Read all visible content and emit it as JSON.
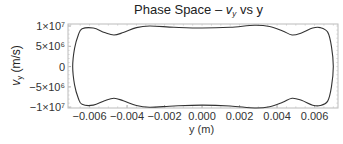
{
  "chart_data": {
    "type": "line",
    "title_parts": {
      "prefix": "Phase Space – ",
      "var": "v",
      "sub": "y",
      "suffix": " vs y"
    },
    "xlabel": "y (m)",
    "ylabel": "v_y (m/s)",
    "ylabel_parts": {
      "var": "v",
      "sub": "y",
      "unit": " (m/s)"
    },
    "xlim": [
      -0.00715,
      0.00725
    ],
    "ylim": [
      -10200000.0,
      10500000.0
    ],
    "x_ticks": [
      -0.006,
      -0.004,
      -0.002,
      0.0,
      0.002,
      0.004,
      0.006
    ],
    "x_tick_labels": [
      "−0.006",
      "−0.004",
      "−0.002",
      "0.000",
      "0.002",
      "0.004",
      "0.006"
    ],
    "y_ticks": [
      10000000,
      5000000,
      0,
      -5000000,
      -10000000
    ],
    "y_tick_labels": [
      "1×10⁷",
      "5×10⁶",
      "0",
      "−5×10⁶",
      "−1×10⁷"
    ],
    "grid": false,
    "legend": null,
    "series": [
      {
        "name": "v_y vs y (closed orbit)",
        "color": "#333333",
        "x": [
          -0.0069,
          -0.0068,
          -0.0066,
          -0.0064,
          -0.0058,
          -0.0052,
          -0.0047,
          -0.0042,
          -0.0035,
          -0.0028,
          -0.0015,
          0.0,
          0.0015,
          0.0028,
          0.0036,
          0.0043,
          0.0048,
          0.0053,
          0.0059,
          0.0063,
          0.0067,
          0.0069,
          0.007,
          0.0069,
          0.0067,
          0.0063,
          0.0059,
          0.0053,
          0.0048,
          0.0043,
          0.0036,
          0.0028,
          0.0015,
          0.0,
          -0.0015,
          -0.0028,
          -0.0035,
          -0.0042,
          -0.0047,
          -0.0052,
          -0.0058,
          -0.0064,
          -0.0066,
          -0.0068,
          -0.0069
        ],
        "y": [
          0,
          4500000,
          7800000,
          9300000,
          9500000,
          8400000,
          7800000,
          8400000,
          9600000,
          10000000,
          9700000,
          9500000,
          9700000,
          10200000,
          9900000,
          8800000,
          7800000,
          8300000,
          9500000,
          9600000,
          8500000,
          5000000,
          0,
          -5000000,
          -8500000,
          -9600000,
          -9500000,
          -8300000,
          -7800000,
          -8800000,
          -9900000,
          -10200000,
          -9700000,
          -9500000,
          -9700000,
          -10000000,
          -9600000,
          -8400000,
          -7800000,
          -8400000,
          -9500000,
          -9300000,
          -7800000,
          -4500000,
          0
        ]
      }
    ]
  }
}
